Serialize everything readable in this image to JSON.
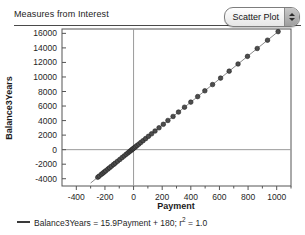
{
  "header": {
    "title": "Measures from Interest",
    "plot_type_selector": {
      "value": "Scatter Plot",
      "up_icon": "triangle-up-icon",
      "down_icon": "triangle-down-icon"
    }
  },
  "legend": {
    "swatch_icon": "line-swatch-icon",
    "prefix": "Balance3Years = 15.9Payment + 180; r",
    "superscript": "2",
    "suffix": " = 1.0",
    "full_text": "Balance3Years = 15.9Payment + 180; r2 = 1.0"
  },
  "colors": {
    "frame": "#555555",
    "reference_line": "#9a9a9a",
    "fit_line": "#8a8a8a",
    "point_fill": "#4d4d4d",
    "point_stroke": "#222222",
    "text": "#1f1f1f"
  },
  "chart_data": {
    "type": "scatter",
    "title": "Measures from Interest",
    "xlabel": "Payment",
    "ylabel": "Balance3Years",
    "xlim": [
      -500,
      1100
    ],
    "ylim": [
      -5000,
      16600
    ],
    "xticks": [
      -400,
      -200,
      0,
      200,
      400,
      600,
      800,
      1000
    ],
    "xticklabels": [
      "-400",
      "-200",
      "0",
      "200",
      "400",
      "600",
      "800",
      "1000"
    ],
    "yticks": [
      -4000,
      -2000,
      0,
      2000,
      4000,
      6000,
      8000,
      10000,
      12000,
      14000,
      16000
    ],
    "yticklabels": [
      "-4000",
      "-2000",
      "0",
      "2000",
      "4000",
      "6000",
      "8000",
      "10000",
      "12000",
      "14000",
      "16000"
    ],
    "grid": false,
    "reference_lines": {
      "x": 0,
      "y": 0
    },
    "legend_position": "below-plot",
    "fit": {
      "equation": "Balance3Years = 15.9Payment + 180; r2 = 1.0",
      "slope": 15.9,
      "intercept": 180,
      "r_squared": 1.0,
      "x_range": [
        -300,
        1020
      ]
    },
    "series": [
      {
        "name": "Balance3Years vs Payment",
        "marker": "circle",
        "x": [
          -250,
          -240,
          -225,
          -215,
          -205,
          -195,
          -180,
          -168,
          -155,
          -140,
          -128,
          -112,
          -96,
          -80,
          -66,
          -52,
          -40,
          -30,
          -22,
          -14,
          -8,
          -2,
          6,
          14,
          24,
          36,
          50,
          66,
          84,
          104,
          126,
          150,
          178,
          208,
          240,
          276,
          314,
          356,
          400,
          448,
          498,
          552,
          608,
          668,
          730,
          796,
          864,
          936,
          1010
        ],
        "y": [
          -3795,
          -3636,
          -3397,
          -3239,
          -3080,
          -2921,
          -2682,
          -2491,
          -2285,
          -2046,
          -1855,
          -1601,
          -1346,
          -1092,
          -869,
          -647,
          -456,
          -297,
          -170,
          -43,
          53,
          148,
          275,
          403,
          562,
          752,
          975,
          1229,
          1516,
          1834,
          2183,
          2565,
          3010,
          3487,
          4016,
          4568,
          5173,
          5840,
          6540,
          7303,
          8098,
          8957,
          9847,
          10801,
          11787,
          12836,
          13918,
          15062,
          16239
        ]
      }
    ]
  }
}
